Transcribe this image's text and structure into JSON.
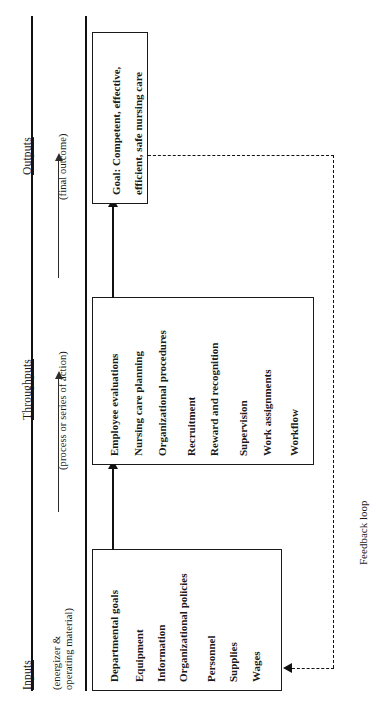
{
  "diagram": {
    "orientation": "rotated-90-ccw",
    "bands": [
      {
        "id": "inputs",
        "label": "Inputs",
        "sublabel_line1": "(energizer &",
        "sublabel_line2": "operating material)"
      },
      {
        "id": "throughputs",
        "label": "Throughputs",
        "sublabel_line1": "(process or series of action)",
        "sublabel_line2": ""
      },
      {
        "id": "outputs",
        "label": "Outputs",
        "sublabel_line1": "(final outcome)",
        "sublabel_line2": ""
      }
    ],
    "boxes": [
      {
        "id": "inputs-box",
        "items": [
          "Departmental goals",
          "Equipment",
          "Information",
          "Organizational policies",
          "Personnel",
          "Supplies",
          "Wages"
        ]
      },
      {
        "id": "throughputs-box",
        "items": [
          "Employee evaluations",
          "Nursing care planning",
          "Organizational procedures",
          "Recruitment",
          "Reward and recognition",
          "Supervision",
          "Work assignments",
          "Workflow"
        ]
      },
      {
        "id": "goal-box",
        "items": [
          "Goal: Competent, effective,",
          "efficient, safe nursing care"
        ]
      }
    ],
    "feedback": {
      "label": "Feedback loop"
    },
    "colors": {
      "ink": "#1a1a1a",
      "rule": "#111111",
      "background": "#ffffff"
    }
  }
}
